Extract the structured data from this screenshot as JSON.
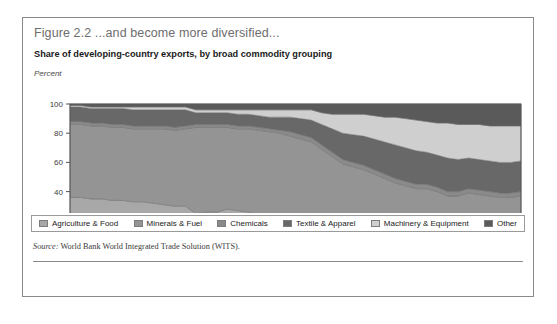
{
  "figure": {
    "title": "Figure 2.2  ...and become more diversified...",
    "subtitle": "Share of developing-country exports, by broad commodity grouping",
    "unit_label": "Percent",
    "source_prefix": "Source:",
    "source_text": " World Bank World Integrated Trade Solution (WITS)."
  },
  "legend": {
    "items": [
      {
        "label": "Agriculture & Food",
        "color": "#a8a8a8"
      },
      {
        "label": "Minerals & Fuel",
        "color": "#949494"
      },
      {
        "label": "Chemicals",
        "color": "#8a8a8a"
      },
      {
        "label": "Textile & Apparel",
        "color": "#686868"
      },
      {
        "label": "Machinery & Equipment",
        "color": "#cfcfcf"
      },
      {
        "label": "Other",
        "color": "#5a5a5a"
      }
    ]
  },
  "chart_data": {
    "type": "area",
    "title": "Share of developing-country exports, by broad commodity grouping",
    "xlabel": "",
    "ylabel": "Percent",
    "ylim": [
      0,
      100
    ],
    "xlim": [
      1962,
      2005
    ],
    "grid": false,
    "stacked": true,
    "legend_position": "bottom",
    "ytick_values": [
      0,
      20,
      40,
      60,
      80,
      100
    ],
    "xtick_labels": [
      1962,
      1967,
      1972,
      1977,
      1982,
      1987,
      1992,
      1997,
      2002
    ],
    "x": [
      1962,
      1963,
      1964,
      1965,
      1966,
      1967,
      1968,
      1969,
      1970,
      1971,
      1972,
      1973,
      1974,
      1975,
      1976,
      1977,
      1978,
      1979,
      1980,
      1981,
      1982,
      1983,
      1984,
      1985,
      1986,
      1987,
      1988,
      1989,
      1990,
      1991,
      1992,
      1993,
      1994,
      1995,
      1996,
      1997,
      1998,
      1999,
      2000,
      2001,
      2002,
      2003,
      2004,
      2005
    ],
    "series": [
      {
        "name": "Agriculture & Food",
        "color": "#a8a8a8",
        "values": [
          36,
          36,
          35,
          35,
          34,
          34,
          33,
          33,
          32,
          31,
          30,
          30,
          25,
          26,
          26,
          28,
          27,
          26,
          24,
          23,
          23,
          23,
          22,
          21,
          22,
          20,
          19,
          18,
          17,
          17,
          16,
          15,
          15,
          14,
          14,
          13,
          13,
          12,
          11,
          11,
          11,
          10,
          9,
          9
        ]
      },
      {
        "name": "Minerals & Fuel",
        "color": "#949494",
        "values": [
          50,
          50,
          50,
          50,
          50,
          50,
          50,
          50,
          51,
          52,
          52,
          53,
          59,
          58,
          58,
          56,
          56,
          57,
          58,
          58,
          57,
          55,
          54,
          53,
          47,
          44,
          40,
          39,
          38,
          35,
          33,
          31,
          29,
          28,
          28,
          27,
          24,
          25,
          28,
          27,
          26,
          26,
          27,
          28
        ]
      },
      {
        "name": "Chemicals",
        "color": "#8a8a8a",
        "values": [
          2,
          2,
          2,
          2,
          2,
          2,
          2,
          2,
          2,
          2,
          2,
          2,
          2,
          2,
          2,
          2,
          2,
          2,
          2,
          2,
          2,
          3,
          3,
          3,
          3,
          3,
          3,
          3,
          3,
          3,
          3,
          3,
          3,
          3,
          3,
          3,
          3,
          3,
          3,
          3,
          3,
          3,
          3,
          3
        ]
      },
      {
        "name": "Textile & Apparel",
        "color": "#686868",
        "values": [
          10,
          10,
          10,
          10,
          11,
          11,
          11,
          11,
          11,
          11,
          12,
          11,
          8,
          8,
          8,
          8,
          8,
          8,
          8,
          8,
          9,
          10,
          11,
          12,
          14,
          16,
          18,
          19,
          20,
          21,
          22,
          23,
          23,
          23,
          22,
          22,
          23,
          22,
          21,
          21,
          21,
          21,
          21,
          21
        ]
      },
      {
        "name": "Machinery & Equipment",
        "color": "#cfcfcf",
        "values": [
          1,
          1,
          1,
          1,
          1,
          1,
          2,
          2,
          2,
          2,
          2,
          2,
          2,
          2,
          2,
          2,
          3,
          3,
          4,
          5,
          5,
          5,
          6,
          7,
          8,
          10,
          13,
          14,
          15,
          16,
          17,
          19,
          20,
          21,
          21,
          22,
          24,
          24,
          23,
          24,
          24,
          25,
          25,
          24
        ]
      },
      {
        "name": "Other",
        "color": "#5a5a5a",
        "values": [
          1,
          1,
          2,
          2,
          2,
          2,
          2,
          2,
          2,
          2,
          2,
          2,
          4,
          4,
          4,
          4,
          4,
          4,
          4,
          4,
          4,
          4,
          4,
          4,
          6,
          7,
          7,
          7,
          7,
          8,
          9,
          9,
          10,
          11,
          12,
          13,
          13,
          14,
          14,
          14,
          15,
          15,
          15,
          15
        ]
      }
    ]
  }
}
